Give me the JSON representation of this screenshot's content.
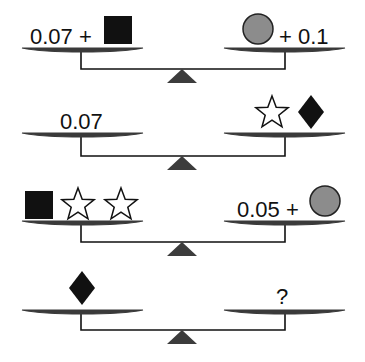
{
  "colors": {
    "plate": "#3a3a3a",
    "beam": "#111111",
    "fulcrum": "#3c3c3c",
    "square": "#111111",
    "diamond": "#111111",
    "circle_fill": "#8c8c8c",
    "circle_stroke": "#222222",
    "star_fill": "#ffffff",
    "star_stroke": "#111111",
    "text": "#111111"
  },
  "scales": [
    {
      "id": "scale-1",
      "plate_y": 49,
      "beam_y": 69,
      "left": [
        {
          "type": "text",
          "value": "0.07 +",
          "x": 30,
          "y": 44
        },
        {
          "type": "square",
          "x": 104,
          "y": 16,
          "size": 28
        }
      ],
      "right": [
        {
          "type": "circle",
          "cx": 258,
          "cy": 29,
          "r": 15
        },
        {
          "type": "text",
          "value": "+ 0.1",
          "x": 279,
          "y": 44
        }
      ]
    },
    {
      "id": "scale-2",
      "plate_y": 134,
      "beam_y": 156,
      "left": [
        {
          "type": "text",
          "value": "0.07",
          "x": 60,
          "y": 129
        }
      ],
      "right": [
        {
          "type": "star",
          "cx": 272,
          "cy": 113,
          "r": 17
        },
        {
          "type": "diamond",
          "cx": 311,
          "cy": 112,
          "w": 26,
          "h": 34
        }
      ]
    },
    {
      "id": "scale-3",
      "plate_y": 222,
      "beam_y": 242,
      "left": [
        {
          "type": "square",
          "x": 25,
          "y": 191,
          "size": 28
        },
        {
          "type": "star",
          "cx": 78,
          "cy": 205,
          "r": 17
        },
        {
          "type": "star",
          "cx": 121,
          "cy": 205,
          "r": 17
        }
      ],
      "right": [
        {
          "type": "text",
          "value": "0.05 +",
          "x": 237,
          "y": 217
        },
        {
          "type": "circle",
          "cx": 325,
          "cy": 201,
          "r": 15
        }
      ]
    },
    {
      "id": "scale-4",
      "plate_y": 311,
      "beam_y": 330,
      "left": [
        {
          "type": "diamond",
          "cx": 82,
          "cy": 288,
          "w": 26,
          "h": 34
        }
      ],
      "right": [
        {
          "type": "text",
          "value": "?",
          "x": 276,
          "y": 304
        }
      ]
    }
  ],
  "geometry": {
    "left_plate": {
      "x1": 22,
      "x2": 143,
      "stem_x": 81
    },
    "right_plate": {
      "x1": 224,
      "x2": 345,
      "stem_x": 285
    },
    "fulcrum": {
      "cx": 182,
      "half_width": 15,
      "height": 14
    }
  }
}
